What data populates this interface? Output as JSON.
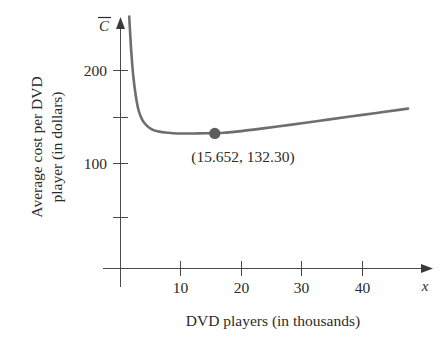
{
  "chart_data": {
    "type": "line",
    "title": "",
    "xlabel": "DVD players (in thousands)",
    "ylabel": "Average cost per DVD player (in dollars)",
    "ylabel_line1": "Average cost per DVD",
    "ylabel_line2": "player (in dollars)",
    "y_axis_variable": "C",
    "y_axis_variable_overbar": true,
    "x_axis_variable": "x",
    "xlim": [
      0,
      47
    ],
    "ylim": [
      0,
      260
    ],
    "x_ticks": [
      10,
      20,
      30,
      40
    ],
    "x_tick_labels": [
      "10",
      "20",
      "30",
      "40"
    ],
    "y_ticks": [
      50,
      100,
      150,
      200
    ],
    "y_tick_labels": [
      "",
      "100",
      "",
      "200"
    ],
    "y_labeled_ticks": [
      100,
      200
    ],
    "grid": false,
    "legend": false,
    "curve_color": "#6e6e6e",
    "axis_color": "#4a4a4a",
    "background_color": "#ffffff",
    "annotations": [
      {
        "name": "minimum-point",
        "text": "(15.652, 132.30)",
        "x": 15.652,
        "y": 132.3
      }
    ],
    "series": [
      {
        "name": "average cost",
        "x": [
          1.55,
          1.7,
          1.9,
          2.2,
          2.6,
          3.1,
          3.7,
          4.4,
          5.2,
          6.2,
          7.4,
          8.8,
          10.4,
          12.2,
          14.2,
          15.652,
          17.5,
          20,
          23,
          26,
          30,
          34,
          38,
          42,
          46,
          47.5
        ],
        "y": [
          258,
          240,
          219,
          195,
          174,
          157,
          147,
          141,
          137,
          134.6,
          133.3,
          132.6,
          132.3,
          132.3,
          132.5,
          132.3,
          133.2,
          134.8,
          137.2,
          139.8,
          143.3,
          146.9,
          150.5,
          154.1,
          157.7,
          159.0
        ]
      }
    ]
  }
}
